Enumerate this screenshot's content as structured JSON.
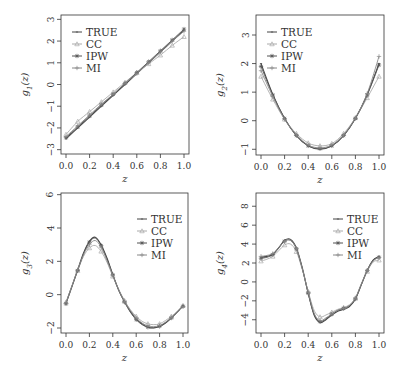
{
  "chart_data": [
    {
      "type": "line",
      "ylabel": "g1(z)",
      "ylabel_base": "g",
      "ylabel_sub": "1",
      "ylabel_arg": "(z)",
      "xlabel": "z",
      "xlim": [
        0,
        1
      ],
      "ylim": [
        -3.2,
        3.2
      ],
      "xticks": [
        "0.0",
        "0.2",
        "0.4",
        "0.6",
        "0.8",
        "1.0"
      ],
      "xtick_values": [
        0,
        0.2,
        0.4,
        0.6,
        0.8,
        1.0
      ],
      "yticks": [
        "-3",
        "-2",
        "-1",
        "0",
        "1",
        "2",
        "3"
      ],
      "ytick_values": [
        -3,
        -2,
        -1,
        0,
        1,
        2,
        3
      ],
      "legend_position": "top-left",
      "x": [
        0,
        0.1,
        0.2,
        0.3,
        0.4,
        0.5,
        0.6,
        0.7,
        0.8,
        0.9,
        1.0
      ],
      "series": [
        {
          "name": "TRUE",
          "color": "#444444",
          "marker": "line",
          "values": [
            -2.5,
            -2.0,
            -1.5,
            -1.0,
            -0.5,
            0.0,
            0.5,
            1.0,
            1.5,
            2.0,
            2.5
          ]
        },
        {
          "name": "CC",
          "color": "#aaaaaa",
          "marker": "triangle",
          "values": [
            -2.3,
            -1.7,
            -1.25,
            -0.8,
            -0.35,
            0.1,
            0.55,
            0.95,
            1.35,
            1.8,
            2.2
          ]
        },
        {
          "name": "IPW",
          "color": "#555555",
          "marker": "star",
          "values": [
            -2.45,
            -1.95,
            -1.45,
            -0.95,
            -0.45,
            0.05,
            0.55,
            1.05,
            1.55,
            2.05,
            2.55
          ]
        },
        {
          "name": "MI",
          "color": "#888888",
          "marker": "plus",
          "values": [
            -2.4,
            -1.9,
            -1.4,
            -0.9,
            -0.45,
            0.05,
            0.5,
            1.0,
            1.5,
            2.0,
            2.45
          ]
        }
      ]
    },
    {
      "type": "line",
      "ylabel": "g2(z)",
      "ylabel_base": "g",
      "ylabel_sub": "2",
      "ylabel_arg": "(z)",
      "xlabel": "z",
      "xlim": [
        0,
        1
      ],
      "ylim": [
        -1.2,
        3.7
      ],
      "xticks": [
        "0.0",
        "0.2",
        "0.4",
        "0.6",
        "0.8",
        "1.0"
      ],
      "xtick_values": [
        0,
        0.2,
        0.4,
        0.6,
        0.8,
        1.0
      ],
      "yticks": [
        "-1",
        "0",
        "1",
        "2",
        "3"
      ],
      "ytick_values": [
        -1,
        0,
        1,
        2,
        3
      ],
      "legend_position": "top-left",
      "x": [
        0,
        0.1,
        0.2,
        0.3,
        0.4,
        0.5,
        0.6,
        0.7,
        0.8,
        0.9,
        1.0
      ],
      "series": [
        {
          "name": "TRUE",
          "color": "#444444",
          "marker": "line",
          "values": [
            2.0,
            0.92,
            0.08,
            -0.52,
            -0.88,
            -1.0,
            -0.88,
            -0.52,
            0.08,
            0.92,
            2.0
          ]
        },
        {
          "name": "CC",
          "color": "#aaaaaa",
          "marker": "triangle",
          "values": [
            1.55,
            0.75,
            0.05,
            -0.45,
            -0.78,
            -0.88,
            -0.8,
            -0.45,
            0.1,
            0.8,
            1.55
          ]
        },
        {
          "name": "IPW",
          "color": "#555555",
          "marker": "star",
          "values": [
            1.9,
            0.9,
            0.08,
            -0.52,
            -0.88,
            -0.98,
            -0.88,
            -0.52,
            0.08,
            0.9,
            1.95
          ]
        },
        {
          "name": "MI",
          "color": "#888888",
          "marker": "plus",
          "values": [
            1.75,
            0.85,
            0.05,
            -0.5,
            -0.85,
            -0.95,
            -0.85,
            -0.5,
            0.1,
            0.95,
            2.25
          ]
        }
      ]
    },
    {
      "type": "line",
      "ylabel": "g3(z)",
      "ylabel_base": "g",
      "ylabel_sub": "3",
      "ylabel_arg": "(z)",
      "xlabel": "z",
      "xlim": [
        0,
        1
      ],
      "ylim": [
        -2.3,
        6.1
      ],
      "xticks": [
        "0.0",
        "0.2",
        "0.4",
        "0.6",
        "0.8",
        "1.0"
      ],
      "xtick_values": [
        0,
        0.2,
        0.4,
        0.6,
        0.8,
        1.0
      ],
      "yticks": [
        "-2",
        "0",
        "2",
        "4",
        "6"
      ],
      "ytick_values": [
        -2,
        0,
        2,
        4,
        6
      ],
      "legend_position": "top-right",
      "x": [
        0,
        0.05,
        0.1,
        0.15,
        0.2,
        0.25,
        0.3,
        0.35,
        0.4,
        0.45,
        0.5,
        0.55,
        0.6,
        0.65,
        0.7,
        0.75,
        0.8,
        0.85,
        0.9,
        0.95,
        1.0
      ],
      "series": [
        {
          "name": "TRUE",
          "color": "#444444",
          "marker": "line",
          "values": [
            -0.5,
            0.5,
            1.5,
            2.5,
            3.2,
            3.45,
            3.0,
            2.2,
            1.2,
            0.3,
            -0.4,
            -1.0,
            -1.45,
            -1.75,
            -1.95,
            -2.0,
            -1.9,
            -1.7,
            -1.4,
            -1.05,
            -0.65
          ]
        },
        {
          "name": "CC",
          "color": "#aaaaaa",
          "marker": "triangle",
          "values": [
            -0.45,
            0.5,
            1.45,
            2.3,
            2.8,
            2.95,
            2.6,
            1.95,
            1.1,
            0.3,
            -0.35,
            -0.9,
            -1.3,
            -1.6,
            -1.75,
            -1.8,
            -1.75,
            -1.55,
            -1.3,
            -1.0,
            -0.65
          ]
        },
        {
          "name": "IPW",
          "color": "#555555",
          "marker": "star",
          "values": [
            -0.55,
            0.45,
            1.45,
            2.45,
            3.15,
            3.4,
            2.95,
            2.15,
            1.2,
            0.25,
            -0.45,
            -1.05,
            -1.5,
            -1.8,
            -1.95,
            -1.98,
            -1.9,
            -1.7,
            -1.4,
            -1.05,
            -0.7
          ]
        },
        {
          "name": "MI",
          "color": "#888888",
          "marker": "plus",
          "values": [
            -0.5,
            0.5,
            1.5,
            2.4,
            3.0,
            3.25,
            2.85,
            2.05,
            1.15,
            0.3,
            -0.4,
            -0.95,
            -1.4,
            -1.7,
            -1.88,
            -1.92,
            -1.85,
            -1.65,
            -1.38,
            -1.05,
            -0.7
          ]
        }
      ]
    },
    {
      "type": "line",
      "ylabel": "g4(z)",
      "ylabel_base": "g",
      "ylabel_sub": "4",
      "ylabel_arg": "(z)",
      "xlabel": "z",
      "xlim": [
        0,
        1
      ],
      "ylim": [
        -5.4,
        9.4
      ],
      "xticks": [
        "0.0",
        "0.2",
        "0.4",
        "0.6",
        "0.8",
        "1.0"
      ],
      "xtick_values": [
        0,
        0.2,
        0.4,
        0.6,
        0.8,
        1.0
      ],
      "yticks": [
        "-4",
        "-2",
        "0",
        "2",
        "4",
        "6",
        "8"
      ],
      "ytick_values": [
        -4,
        -2,
        0,
        2,
        4,
        6,
        8
      ],
      "legend_position": "top-right",
      "x": [
        0,
        0.05,
        0.1,
        0.15,
        0.2,
        0.25,
        0.3,
        0.35,
        0.4,
        0.45,
        0.5,
        0.55,
        0.6,
        0.65,
        0.7,
        0.75,
        0.8,
        0.85,
        0.9,
        0.95,
        1.0
      ],
      "series": [
        {
          "name": "TRUE",
          "color": "#444444",
          "marker": "line",
          "values": [
            2.6,
            2.7,
            2.9,
            3.6,
            4.4,
            4.5,
            3.6,
            1.5,
            -1.2,
            -3.5,
            -4.3,
            -4.0,
            -3.5,
            -3.1,
            -2.9,
            -2.6,
            -1.8,
            -0.3,
            1.2,
            2.3,
            2.7
          ]
        },
        {
          "name": "CC",
          "color": "#aaaaaa",
          "marker": "triangle",
          "values": [
            2.2,
            2.4,
            2.7,
            3.3,
            3.9,
            4.0,
            3.2,
            1.3,
            -1.0,
            -3.0,
            -3.7,
            -3.5,
            -3.2,
            -2.9,
            -2.7,
            -2.4,
            -1.7,
            -0.3,
            1.1,
            2.1,
            2.3
          ]
        },
        {
          "name": "IPW",
          "color": "#555555",
          "marker": "star",
          "values": [
            2.5,
            2.6,
            2.9,
            3.6,
            4.3,
            4.4,
            3.5,
            1.4,
            -1.2,
            -3.4,
            -4.2,
            -3.9,
            -3.4,
            -3.0,
            -2.8,
            -2.5,
            -1.8,
            -0.3,
            1.2,
            2.3,
            2.6
          ]
        },
        {
          "name": "MI",
          "color": "#888888",
          "marker": "plus",
          "values": [
            2.7,
            2.8,
            3.0,
            3.6,
            4.3,
            4.4,
            3.5,
            1.4,
            -1.1,
            -3.3,
            -4.1,
            -3.8,
            -3.4,
            -3.0,
            -2.8,
            -2.5,
            -1.7,
            -0.2,
            1.2,
            2.2,
            2.6
          ]
        }
      ]
    }
  ]
}
